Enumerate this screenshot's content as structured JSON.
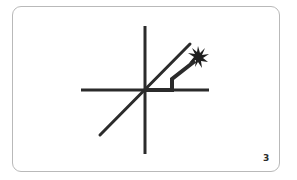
{
  "card": {
    "page_number": "3"
  },
  "diagram": {
    "stroke_color": "#2b2b2b",
    "elements": [
      "horizontal-axis",
      "vertical-axis",
      "diagonal-line",
      "bent-wire",
      "spark-starburst"
    ]
  }
}
